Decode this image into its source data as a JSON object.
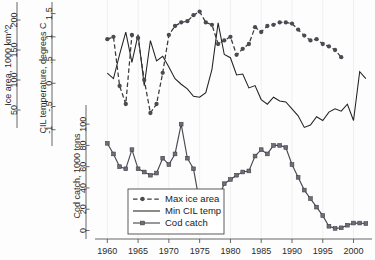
{
  "figure": {
    "background": "#fdfdfd",
    "ink": "#2b2b2b"
  },
  "axes": {
    "x": {
      "label": "",
      "ticks": [
        "1960",
        "1965",
        "1970",
        "1975",
        "1980",
        "1985",
        "1990",
        "1995",
        "2000"
      ],
      "tick_values": [
        1960,
        1965,
        1970,
        1975,
        1980,
        1985,
        1990,
        1995,
        2000
      ],
      "range": [
        1958,
        2003
      ]
    },
    "y_ice": {
      "label": "Ice area, 1000 km^2",
      "ticks": [
        "50",
        "100",
        "150",
        "200"
      ],
      "tick_values": [
        50,
        100,
        150,
        200
      ],
      "range": [
        20,
        230
      ]
    },
    "y_cil": {
      "label": "CIL temperature, degrees C",
      "ticks": [
        "-1",
        "-.5",
        "0",
        ".5",
        "1",
        "1.5"
      ],
      "tick_values": [
        -1,
        -0.5,
        0,
        0.5,
        1,
        1.5
      ],
      "range": [
        -1.35,
        1.75
      ]
    },
    "y_cod": {
      "label": "Cod catch, 1000 tons",
      "ticks": [
        "0",
        "20",
        "40",
        "60",
        "80",
        "100"
      ],
      "tick_values": [
        0,
        20,
        40,
        60,
        80,
        100
      ],
      "range": [
        -8,
        118
      ]
    }
  },
  "legend": {
    "position": "bottom-left-inside",
    "items": [
      {
        "label": "Max ice area",
        "style": "dashed-with-circles",
        "color": "#3a3a3a"
      },
      {
        "label": "Min CIL temp",
        "style": "solid-line",
        "color": "#222222"
      },
      {
        "label": "Cod catch",
        "style": "solid-with-squares",
        "color": "#4a4a52"
      }
    ]
  },
  "chart_data": {
    "type": "line",
    "title": "",
    "xlabel": "",
    "ylabel": "Ice area, 1000 km^2 / CIL temperature, degrees C / Cod catch, 1000 tons",
    "x": [
      1960,
      1961,
      1962,
      1963,
      1964,
      1965,
      1966,
      1967,
      1968,
      1969,
      1970,
      1971,
      1972,
      1973,
      1974,
      1975,
      1976,
      1977,
      1978,
      1979,
      1980,
      1981,
      1982,
      1983,
      1984,
      1985,
      1986,
      1987,
      1988,
      1989,
      1990,
      1991,
      1992,
      1993,
      1994,
      1995,
      1996,
      1997,
      1998,
      1999,
      2000,
      2001,
      2002
    ],
    "xlim": [
      1958,
      2003
    ],
    "grid": "vertical-light",
    "legend_position": "bottom-left",
    "series": [
      {
        "name": "Max ice area",
        "axis": "y_ice",
        "units": "1000 km^2",
        "style": "dashed-with-circles",
        "ylim": [
          20,
          230
        ],
        "values": [
          168,
          172,
          90,
          60,
          175,
          170,
          100,
          45,
          60,
          112,
          175,
          190,
          196,
          198,
          208,
          214,
          196,
          192,
          160,
          166,
          172,
          142,
          152,
          160,
          188,
          180,
          190,
          192,
          196,
          196,
          194,
          184,
          174,
          166,
          168,
          160,
          156,
          150,
          138,
          null,
          null,
          null,
          null
        ]
      },
      {
        "name": "Min CIL temp",
        "axis": "y_cil",
        "units": "degrees C",
        "style": "solid-line",
        "ylim": [
          -1.35,
          1.75
        ],
        "values": [
          0.22,
          0.1,
          0.62,
          1.1,
          0.45,
          1.05,
          -0.05,
          0.92,
          0.48,
          0.58,
          0.35,
          0.1,
          -0.02,
          -0.12,
          -0.28,
          -0.3,
          -0.2,
          0.3,
          1.3,
          0.62,
          0.55,
          0.18,
          0.2,
          -0.1,
          -0.05,
          -0.35,
          -0.45,
          -0.3,
          -0.38,
          -0.4,
          -0.55,
          -0.7,
          -0.95,
          -0.9,
          -0.72,
          -0.8,
          -0.62,
          -0.55,
          -0.6,
          -0.45,
          -0.8,
          0.25,
          0.1
        ]
      },
      {
        "name": "Cod catch",
        "axis": "y_cod",
        "units": "1000 tons",
        "style": "solid-with-squares",
        "ylim": [
          -8,
          118
        ],
        "values": [
          82,
          72,
          60,
          58,
          76,
          58,
          55,
          52,
          54,
          68,
          62,
          72,
          100,
          68,
          58,
          26,
          30,
          32,
          30,
          44,
          48,
          52,
          55,
          56,
          70,
          76,
          72,
          80,
          80,
          78,
          62,
          50,
          38,
          30,
          22,
          14,
          4,
          2,
          2.5,
          5,
          7,
          7,
          6.5
        ]
      }
    ]
  }
}
